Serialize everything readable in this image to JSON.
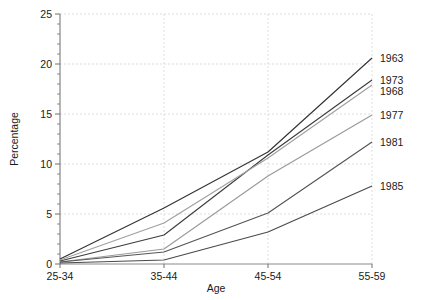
{
  "chart_data": {
    "type": "line",
    "title": "",
    "subtitle": "",
    "xlabel": "Age",
    "ylabel": "Percentage",
    "categories": [
      "25-34",
      "35-44",
      "45-54",
      "55-59"
    ],
    "xlim": [
      0,
      3
    ],
    "ylim": [
      0,
      25
    ],
    "yticks": [
      0,
      5,
      10,
      15,
      20,
      25
    ],
    "ytick_labels": [
      "0",
      "5",
      "10",
      "15",
      "20",
      "25"
    ],
    "yminor_step": 1,
    "grid": true,
    "grid_style": "dashed",
    "legend_position": "right-inline-end-of-line",
    "series": [
      {
        "name": "1963",
        "color": "#333333",
        "values": [
          0.5,
          5.6,
          11.2,
          20.6
        ]
      },
      {
        "name": "1973",
        "color": "#3d3d3d",
        "values": [
          0.3,
          2.9,
          10.9,
          18.4
        ]
      },
      {
        "name": "1968",
        "color": "#a0a0a0",
        "values": [
          0.4,
          4.1,
          10.6,
          17.9
        ]
      },
      {
        "name": "1977",
        "color": "#9a9a9a",
        "values": [
          0.2,
          1.5,
          8.8,
          14.9
        ]
      },
      {
        "name": "1981",
        "color": "#555555",
        "values": [
          0.2,
          1.2,
          5.1,
          12.2
        ]
      },
      {
        "name": "1985",
        "color": "#4a4a4a",
        "values": [
          0.1,
          0.4,
          3.2,
          7.8
        ]
      }
    ]
  },
  "axes": {
    "x_title": "Age",
    "y_title": "Percentage"
  }
}
